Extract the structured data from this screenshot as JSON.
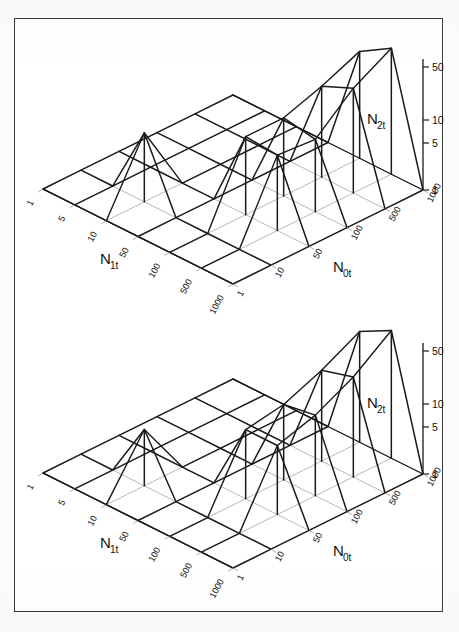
{
  "figure": {
    "background_color": "#fcfcfb",
    "panel_color": "#ffffff",
    "frame_color": "#3a3a3c",
    "grid_color": "#9a9a9e",
    "surface_color": "#1a1a1a"
  },
  "charts": [
    {
      "id": "top",
      "type": "line",
      "title": "",
      "xlabel": "N<sub>1t</sub>",
      "ylabel": "N<sub>0t</sub>",
      "zlabel": "N<sub>2t</sub>",
      "x_label_text": "N",
      "x_label_sub": "1t",
      "y_label_text": "N",
      "y_label_sub": "0t",
      "z_label_text": "N",
      "z_label_sub": "2t",
      "x_ticks": [
        "1",
        "5",
        "10",
        "50",
        "100",
        "500",
        "1000"
      ],
      "y_ticks": [
        "1",
        "10",
        "50",
        "100",
        "500",
        "1000"
      ],
      "z_ticks": [
        "1",
        "5",
        "10",
        "50"
      ],
      "x_scale": "log",
      "y_scale": "log",
      "z_scale": "log",
      "zlim": [
        1,
        70
      ],
      "grid": true,
      "legend": "none",
      "series": [
        {
          "name": "N0t=1",
          "values": [
            1,
            1,
            1,
            1,
            1,
            1,
            1
          ]
        },
        {
          "name": "N0t=10",
          "values": [
            1,
            1,
            9,
            1,
            1,
            1,
            1
          ]
        },
        {
          "name": "N0t=50",
          "values": [
            1,
            1,
            1,
            1,
            12,
            11,
            1
          ]
        },
        {
          "name": "N0t=100",
          "values": [
            1,
            1,
            1,
            1,
            12,
            10,
            1
          ]
        },
        {
          "name": "N0t=500",
          "values": [
            1,
            1,
            1,
            1,
            18,
            28,
            1
          ]
        },
        {
          "name": "N0t=1000",
          "values": [
            1,
            1,
            1,
            1,
            30,
            55,
            1
          ]
        }
      ]
    },
    {
      "id": "bottom",
      "type": "line",
      "title": "",
      "xlabel": "N<sub>1t</sub>",
      "ylabel": "N<sub>0t</sub>",
      "zlabel": "N<sub>2t</sub>",
      "x_label_text": "N",
      "x_label_sub": "1t",
      "y_label_text": "N",
      "y_label_sub": "0t",
      "z_label_text": "N",
      "z_label_sub": "2t",
      "x_ticks": [
        "1",
        "5",
        "10",
        "50",
        "100",
        "500",
        "1000"
      ],
      "y_ticks": [
        "1",
        "10",
        "50",
        "100",
        "500",
        "1000"
      ],
      "z_ticks": [
        "1",
        "5",
        "10",
        "50"
      ],
      "x_scale": "log",
      "y_scale": "log",
      "z_scale": "log",
      "zlim": [
        1,
        70
      ],
      "grid": true,
      "legend": "none",
      "series": [
        {
          "name": "N0t=1",
          "values": [
            1,
            1,
            1,
            1,
            1,
            1,
            1
          ]
        },
        {
          "name": "N0t=10",
          "values": [
            1,
            1,
            6,
            1,
            1,
            1,
            1
          ]
        },
        {
          "name": "N0t=50",
          "values": [
            1,
            1,
            1,
            1,
            9,
            9,
            1
          ]
        },
        {
          "name": "N0t=100",
          "values": [
            1,
            1,
            1,
            1,
            11,
            13,
            1
          ]
        },
        {
          "name": "N0t=500",
          "values": [
            1,
            1,
            1,
            1,
            18,
            24,
            1
          ]
        },
        {
          "name": "N0t=1000",
          "values": [
            1,
            1,
            1,
            1,
            34,
            58,
            1
          ]
        }
      ]
    }
  ]
}
